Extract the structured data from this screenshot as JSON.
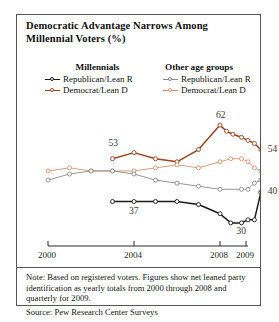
{
  "title": "Democratic Advantage Narrows Among Millennial Voters (%)",
  "legend": {
    "groups": [
      {
        "heading": "Millennials",
        "entries": [
          {
            "label": "Republican/Lean R",
            "color": "#1b1b1b",
            "icon": "line-marker-icon"
          },
          {
            "label": "Democrat/Lean D",
            "color": "#9e4221",
            "icon": "line-marker-icon"
          }
        ]
      },
      {
        "heading": "Other age groups",
        "entries": [
          {
            "label": "Republican/Lean R",
            "color": "#8a8a8a",
            "icon": "line-marker-icon"
          },
          {
            "label": "Democrat/Lean D",
            "color": "#d79270",
            "icon": "line-marker-icon"
          }
        ]
      }
    ]
  },
  "axis": {
    "ticks": [
      {
        "label": "2000",
        "x": 31
      },
      {
        "label": "2004",
        "x": 117
      },
      {
        "label": "2008",
        "x": 203
      },
      {
        "label": "2009",
        "x": 229
      }
    ],
    "line_start_x": 31,
    "line_end_x": 231
  },
  "note": "Note: Based on registered voters. Figures show net leaned party identification as yearly totals from 2000 through 2008 and quarterly for 2009.",
  "source": "Source: Pew Research Center Surveys",
  "chart_data": {
    "type": "line",
    "title": "Democratic Advantage Narrows Among Millennial Voters (%)",
    "xlabel": "",
    "ylabel": "",
    "ylim": [
      28,
      64
    ],
    "grid": false,
    "legend_position": "top",
    "annotations": [
      {
        "text": "53",
        "series": "Millennials Democrat/Lean D",
        "x": "2003",
        "value": 53
      },
      {
        "text": "62",
        "series": "Millennials Democrat/Lean D",
        "x": "2008",
        "value": 62
      },
      {
        "text": "54",
        "series": "Millennials Democrat/Lean D",
        "x": "2009 Q4",
        "value": 54
      },
      {
        "text": "37",
        "series": "Millennials Republican/Lean R",
        "x": "2003",
        "value": 37
      },
      {
        "text": "30",
        "series": "Millennials Republican/Lean R",
        "x": "2009 Q1",
        "value": 30
      },
      {
        "text": "40",
        "series": "Millennials Republican/Lean R",
        "x": "2009 Q4",
        "value": 40
      }
    ],
    "series": [
      {
        "name": "Millennials Democrat/Lean D",
        "color": "#9e4221",
        "x": [
          "2003",
          "2004",
          "2005",
          "2006",
          "2007",
          "2008",
          "2008.3",
          "2008.6",
          "2009 Q1",
          "2009 Q2",
          "2009 Q3",
          "2009 Q4"
        ],
        "values": [
          51,
          53,
          51,
          50,
          54,
          62,
          60,
          59,
          58,
          57,
          56,
          54
        ]
      },
      {
        "name": "Millennials Republican/Lean R",
        "color": "#1b1b1b",
        "x": [
          "2003",
          "2004",
          "2005",
          "2006",
          "2007",
          "2008",
          "2008.5",
          "2009 Q1",
          "2009 Q2",
          "2009 Q3",
          "2009 Q4"
        ],
        "values": [
          37,
          37,
          37,
          37,
          36,
          33,
          30,
          30,
          31,
          31,
          40
        ]
      },
      {
        "name": "Other age groups Democrat/Lean D",
        "color": "#d79270",
        "x": [
          "2000",
          "2001",
          "2002",
          "2003",
          "2004",
          "2005",
          "2006",
          "2007",
          "2008",
          "2008.5",
          "2009 Q1",
          "2009 Q2",
          "2009 Q3",
          "2009 Q4"
        ],
        "values": [
          47,
          48,
          47,
          47,
          47,
          48,
          49,
          48,
          50,
          51,
          51,
          50,
          48,
          47
        ]
      },
      {
        "name": "Other age groups Republican/Lean R",
        "color": "#8a8a8a",
        "x": [
          "2000",
          "2001",
          "2002",
          "2003",
          "2004",
          "2005",
          "2006",
          "2007",
          "2008",
          "2009 Q1",
          "2009 Q2",
          "2009 Q3",
          "2009 Q4"
        ],
        "values": [
          44,
          46,
          47,
          47,
          46,
          44,
          43,
          42,
          41,
          41,
          41,
          43,
          44
        ]
      }
    ]
  }
}
